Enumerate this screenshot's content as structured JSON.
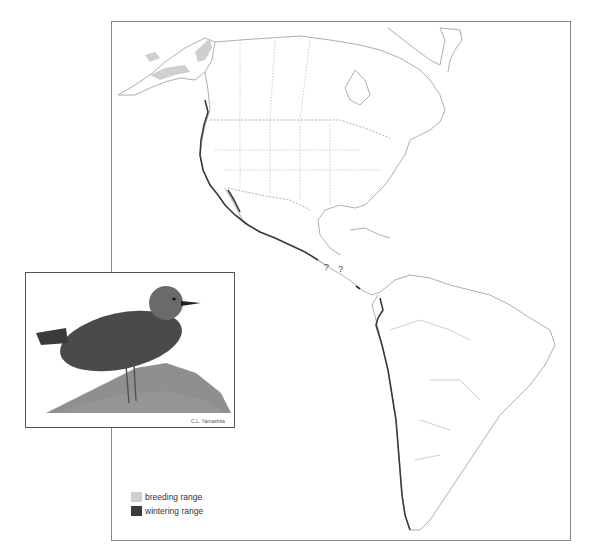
{
  "map": {
    "type": "species range map",
    "region": "Americas",
    "uncertainty_marks": [
      "?",
      "?"
    ]
  },
  "legend": {
    "items": [
      {
        "label": "breeding range",
        "color": "#cfcfcf"
      },
      {
        "label": "wintering range",
        "color": "#3a3a3a"
      }
    ]
  },
  "inset": {
    "subject": "shorebird illustration (stippled ink drawing) standing on rock",
    "signature": "C.L. Yamashita"
  },
  "colors": {
    "breeding": "#cfcfcf",
    "wintering": "#3a3a3a",
    "outline": "#9a9a9a",
    "frame": "#8a8a8a"
  }
}
